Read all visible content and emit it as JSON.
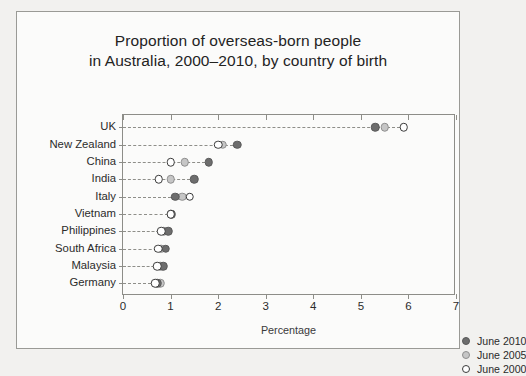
{
  "chart_data": {
    "type": "scatter",
    "title": "Proportion of overseas-born people in Australia, 2000–2010, by country of birth",
    "title_lines": [
      "Proportion of overseas-born people",
      "in Australia, 2000–2010, by country of birth"
    ],
    "xlabel": "Percentage",
    "ylabel": "",
    "xlim": [
      0,
      7
    ],
    "xticks": [
      "0",
      "1",
      "2",
      "3",
      "4",
      "5",
      "6",
      "7"
    ],
    "xtick_values": [
      0,
      1,
      2,
      3,
      4,
      5,
      6,
      7
    ],
    "grid": false,
    "dotted_leader_lines": true,
    "legend_position": "inside-right",
    "categories": [
      "UK",
      "New Zealand",
      "China",
      "India",
      "Italy",
      "Vietnam",
      "Philippines",
      "South Africa",
      "Malaysia",
      "Germany"
    ],
    "series": [
      {
        "name": "June 2010",
        "marker": "filled-dark",
        "color": "#6d6d6d",
        "values": [
          5.3,
          2.4,
          1.8,
          1.5,
          1.1,
          1.03,
          0.95,
          0.9,
          0.85,
          0.72
        ]
      },
      {
        "name": "June 2005",
        "marker": "filled-light",
        "color": "#c6c6c6",
        "values": [
          5.5,
          2.1,
          1.3,
          1.0,
          1.25,
          1.0,
          0.86,
          0.8,
          0.78,
          0.78
        ]
      },
      {
        "name": "June 2000",
        "marker": "open",
        "color": "#ffffff",
        "values": [
          5.9,
          2.0,
          1.0,
          0.75,
          1.4,
          1.0,
          0.8,
          0.74,
          0.72,
          0.68
        ]
      }
    ]
  },
  "legend": {
    "entries": [
      {
        "label": "June 2010"
      },
      {
        "label": "June 2005"
      },
      {
        "label": "June 2000"
      }
    ]
  }
}
